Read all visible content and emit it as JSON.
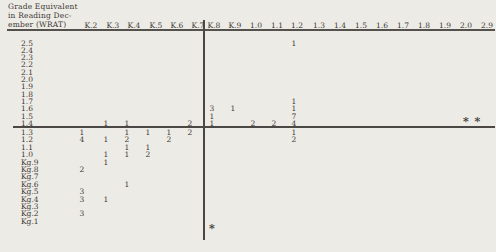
{
  "figure": {
    "bg_color": "#edebe6",
    "text_color": "#3c3835",
    "line_color": "#4a4744"
  },
  "title": {
    "line1": "Grade Equivalent",
    "line2": "in Reading Dec-",
    "line3": "ember (WRAT)"
  },
  "table": {
    "columns": [
      {
        "label": "K.2",
        "hx": 91,
        "vx": 82
      },
      {
        "label": "K.3",
        "hx": 113,
        "vx": 106
      },
      {
        "label": "K.4",
        "hx": 134,
        "vx": 127
      },
      {
        "label": "K.5",
        "hx": 156,
        "vx": 148
      },
      {
        "label": "K.6",
        "hx": 177,
        "vx": 169
      },
      {
        "label": "K.7",
        "hx": 198,
        "vx": 190
      },
      {
        "label": "K.8",
        "hx": 214,
        "vx": 212
      },
      {
        "label": "K.9",
        "hx": 235,
        "vx": 233
      },
      {
        "label": "1.0",
        "hx": 256,
        "vx": 253
      },
      {
        "label": "1.1",
        "hx": 277,
        "vx": 274
      },
      {
        "label": "1.2",
        "hx": 297,
        "vx": 294
      },
      {
        "label": "1.3",
        "hx": 319,
        "vx": 316
      },
      {
        "label": "1.4",
        "hx": 340,
        "vx": 337
      },
      {
        "label": "1.5",
        "hx": 361,
        "vx": 358
      },
      {
        "label": "1.6",
        "hx": 382,
        "vx": 379
      },
      {
        "label": "1.7",
        "hx": 403,
        "vx": 400
      },
      {
        "label": "1.8",
        "hx": 424,
        "vx": 421
      },
      {
        "label": "1.9",
        "hx": 445,
        "vx": 442
      },
      {
        "label": "2.0",
        "hx": 466,
        "vx": 466
      },
      {
        "label": "2.9",
        "hx": 487,
        "vx": 478
      }
    ],
    "rows": [
      {
        "label": "2.5",
        "y": 42.5
      },
      {
        "label": "2.4",
        "y": 49.8
      },
      {
        "label": "2.3",
        "y": 57.1
      },
      {
        "label": "2.2",
        "y": 64.4
      },
      {
        "label": "2.1",
        "y": 71.7
      },
      {
        "label": "2.0",
        "y": 79.0
      },
      {
        "label": "1.9",
        "y": 86.3
      },
      {
        "label": "1.8",
        "y": 93.6
      },
      {
        "label": "1.7",
        "y": 100.9
      },
      {
        "label": "1.6",
        "y": 108.2
      },
      {
        "label": "1.5",
        "y": 115.5
      },
      {
        "label": "1.4",
        "y": 122.8
      },
      {
        "label": "1.3",
        "y": 132.0
      },
      {
        "label": "1.2",
        "y": 139.4
      },
      {
        "label": "1.1",
        "y": 146.8
      },
      {
        "label": "1.0",
        "y": 154.2
      },
      {
        "label": "Kg.9",
        "y": 161.6
      },
      {
        "label": "Kg.8",
        "y": 169.0
      },
      {
        "label": "Kg.7",
        "y": 176.4
      },
      {
        "label": "Kg.6",
        "y": 183.8
      },
      {
        "label": "Kg.5",
        "y": 191.2
      },
      {
        "label": "Kg.4",
        "y": 198.6
      },
      {
        "label": "Kg.3",
        "y": 206.0
      },
      {
        "label": "Kg.2",
        "y": 213.4
      },
      {
        "label": "Kg.1",
        "y": 220.8
      }
    ],
    "cells": [
      {
        "row": "2.5",
        "col": "1.2",
        "value": 1
      },
      {
        "row": "1.7",
        "col": "1.2",
        "value": 1
      },
      {
        "row": "1.6",
        "col": "K.8",
        "value": 3
      },
      {
        "row": "1.6",
        "col": "K.9",
        "value": 1
      },
      {
        "row": "1.6",
        "col": "1.2",
        "value": 1
      },
      {
        "row": "1.5",
        "col": "K.8",
        "value": 1
      },
      {
        "row": "1.5",
        "col": "1.2",
        "value": 7
      },
      {
        "row": "1.4",
        "col": "K.3",
        "value": 1
      },
      {
        "row": "1.4",
        "col": "K.4",
        "value": 1
      },
      {
        "row": "1.4",
        "col": "K.7",
        "value": 2
      },
      {
        "row": "1.4",
        "col": "K.8",
        "value": 1
      },
      {
        "row": "1.4",
        "col": "1.0",
        "value": 2
      },
      {
        "row": "1.4",
        "col": "1.1",
        "value": 2
      },
      {
        "row": "1.4",
        "col": "1.2",
        "value": 4
      },
      {
        "row": "1.3",
        "col": "K.2",
        "value": 1
      },
      {
        "row": "1.3",
        "col": "K.4",
        "value": 1
      },
      {
        "row": "1.3",
        "col": "K.5",
        "value": 1
      },
      {
        "row": "1.3",
        "col": "K.6",
        "value": 1
      },
      {
        "row": "1.3",
        "col": "K.7",
        "value": 2
      },
      {
        "row": "1.3",
        "col": "1.2",
        "value": 1
      },
      {
        "row": "1.2",
        "col": "K.2",
        "value": 4
      },
      {
        "row": "1.2",
        "col": "K.3",
        "value": 1
      },
      {
        "row": "1.2",
        "col": "K.4",
        "value": 2
      },
      {
        "row": "1.2",
        "col": "K.6",
        "value": 2
      },
      {
        "row": "1.2",
        "col": "1.2",
        "value": 2
      },
      {
        "row": "1.1",
        "col": "K.4",
        "value": 1
      },
      {
        "row": "1.1",
        "col": "K.5",
        "value": 1
      },
      {
        "row": "1.0",
        "col": "K.3",
        "value": 1
      },
      {
        "row": "1.0",
        "col": "K.4",
        "value": 1
      },
      {
        "row": "1.0",
        "col": "K.5",
        "value": 2
      },
      {
        "row": "Kg.9",
        "col": "K.3",
        "value": 1
      },
      {
        "row": "Kg.8",
        "col": "K.2",
        "value": 2
      },
      {
        "row": "Kg.6",
        "col": "K.4",
        "value": 1
      },
      {
        "row": "Kg.5",
        "col": "K.2",
        "value": 3
      },
      {
        "row": "Kg.4",
        "col": "K.2",
        "value": 3
      },
      {
        "row": "Kg.4",
        "col": "K.3",
        "value": 1
      },
      {
        "row": "Kg.2",
        "col": "K.2",
        "value": 3
      }
    ],
    "asterisks": [
      {
        "marker": "*",
        "x": 466,
        "y": 120.5
      },
      {
        "marker": "*",
        "x": 477.5,
        "y": 120.5
      },
      {
        "marker": "*",
        "x": 212,
        "y": 227.5
      }
    ]
  },
  "chart_data": {
    "type": "heatmap",
    "title": "",
    "xlabel": "",
    "ylabel": "Grade Equivalent in Reading December (WRAT)",
    "x_categories": [
      "K.2",
      "K.3",
      "K.4",
      "K.5",
      "K.6",
      "K.7",
      "K.8",
      "K.9",
      "1.0",
      "1.1",
      "1.2",
      "1.3",
      "1.4",
      "1.5",
      "1.6",
      "1.7",
      "1.8",
      "1.9",
      "2.0",
      "2.9"
    ],
    "y_categories": [
      "2.5",
      "2.4",
      "2.3",
      "2.2",
      "2.1",
      "2.0",
      "1.9",
      "1.8",
      "1.7",
      "1.6",
      "1.5",
      "1.4",
      "1.3",
      "1.2",
      "1.1",
      "1.0",
      "Kg.9",
      "Kg.8",
      "Kg.7",
      "Kg.6",
      "Kg.5",
      "Kg.4",
      "Kg.3",
      "Kg.2",
      "Kg.1"
    ],
    "points": [
      {
        "x": "1.2",
        "y": "2.5",
        "count": 1
      },
      {
        "x": "1.2",
        "y": "1.7",
        "count": 1
      },
      {
        "x": "K.8",
        "y": "1.6",
        "count": 3
      },
      {
        "x": "K.9",
        "y": "1.6",
        "count": 1
      },
      {
        "x": "1.2",
        "y": "1.6",
        "count": 1
      },
      {
        "x": "K.8",
        "y": "1.5",
        "count": 1
      },
      {
        "x": "1.2",
        "y": "1.5",
        "count": 7
      },
      {
        "x": "K.3",
        "y": "1.4",
        "count": 1
      },
      {
        "x": "K.4",
        "y": "1.4",
        "count": 1
      },
      {
        "x": "K.7",
        "y": "1.4",
        "count": 2
      },
      {
        "x": "K.8",
        "y": "1.4",
        "count": 1
      },
      {
        "x": "1.0",
        "y": "1.4",
        "count": 2
      },
      {
        "x": "1.1",
        "y": "1.4",
        "count": 2
      },
      {
        "x": "1.2",
        "y": "1.4",
        "count": 4
      },
      {
        "x": "K.2",
        "y": "1.3",
        "count": 1
      },
      {
        "x": "K.4",
        "y": "1.3",
        "count": 1
      },
      {
        "x": "K.5",
        "y": "1.3",
        "count": 1
      },
      {
        "x": "K.6",
        "y": "1.3",
        "count": 1
      },
      {
        "x": "K.7",
        "y": "1.3",
        "count": 2
      },
      {
        "x": "1.2",
        "y": "1.3",
        "count": 1
      },
      {
        "x": "K.2",
        "y": "1.2",
        "count": 4
      },
      {
        "x": "K.3",
        "y": "1.2",
        "count": 1
      },
      {
        "x": "K.4",
        "y": "1.2",
        "count": 2
      },
      {
        "x": "K.6",
        "y": "1.2",
        "count": 2
      },
      {
        "x": "1.2",
        "y": "1.2",
        "count": 2
      },
      {
        "x": "K.4",
        "y": "1.1",
        "count": 1
      },
      {
        "x": "K.5",
        "y": "1.1",
        "count": 1
      },
      {
        "x": "K.3",
        "y": "1.0",
        "count": 1
      },
      {
        "x": "K.4",
        "y": "1.0",
        "count": 1
      },
      {
        "x": "K.5",
        "y": "1.0",
        "count": 2
      },
      {
        "x": "K.3",
        "y": "Kg.9",
        "count": 1
      },
      {
        "x": "K.2",
        "y": "Kg.8",
        "count": 2
      },
      {
        "x": "K.4",
        "y": "Kg.6",
        "count": 1
      },
      {
        "x": "K.2",
        "y": "Kg.5",
        "count": 3
      },
      {
        "x": "K.2",
        "y": "Kg.4",
        "count": 3
      },
      {
        "x": "K.3",
        "y": "Kg.4",
        "count": 1
      },
      {
        "x": "K.2",
        "y": "Kg.2",
        "count": 3
      }
    ],
    "annotations": [
      {
        "text": "* *",
        "row": "1.4",
        "cols": "2.0-2.9"
      },
      {
        "text": "*",
        "col": "K.8",
        "position": "below Kg.1"
      }
    ],
    "layout_hints": {
      "grid": false,
      "vertical_divider_between_cols": [
        "K.7",
        "K.8"
      ],
      "horizontal_divider_between_rows": [
        "1.4",
        "1.3"
      ],
      "header_underline": true
    }
  }
}
